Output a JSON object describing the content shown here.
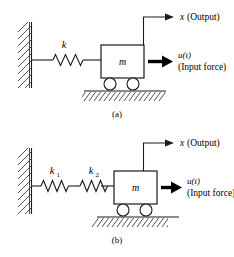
{
  "figure": {
    "background_color": "#ffffff",
    "stroke_color": "#1a1a1a",
    "width": 234,
    "height": 257
  },
  "panels": [
    {
      "id": "panel-a",
      "caption": "(a)",
      "description": "Mass on wheels attached to a fixed wall by a single spring",
      "spring_labels": [
        "k"
      ],
      "mass_label": "m",
      "output_label": "x",
      "output_annotation": "(Output)",
      "input_label": "u(t)",
      "input_annotation": "(Input force)"
    },
    {
      "id": "panel-b",
      "caption": "(b)",
      "description": "Mass on wheels attached to a fixed wall by two springs in series",
      "spring_labels": [
        "k",
        "k"
      ],
      "spring_subscripts": [
        "1",
        "2"
      ],
      "mass_label": "m",
      "output_label": "x",
      "output_annotation": "(Output)",
      "input_label": "u(t)",
      "input_annotation": "(Input force)"
    }
  ],
  "elements": {
    "wall": "fixed-wall-hatched",
    "ground": "ground-hatched",
    "spring": "coil-spring-zigzag",
    "mass_block": "rectangular-mass",
    "wheels": "two-circular-wheels",
    "output_arrow": "displacement-arrow-right",
    "input_arrow": "force-arrow-right-bold"
  }
}
